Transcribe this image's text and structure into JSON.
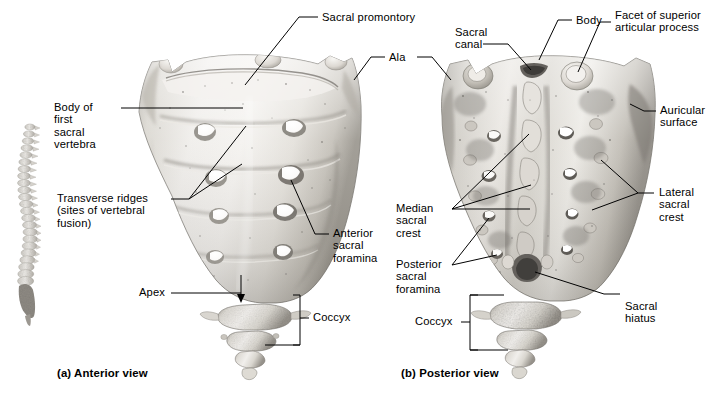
{
  "figure": {
    "background_color": "#ffffff",
    "ink_color": "#000000",
    "bone_tone_light": "#f2f0ec",
    "bone_tone_mid": "#c9c6bf",
    "bone_tone_dark": "#8d8a84"
  },
  "captions": {
    "a": "(a) Anterior view",
    "b": "(b) Posterior view"
  },
  "labels": {
    "sacral_promontory": "Sacral promontory",
    "ala": "Ala",
    "sacral_canal": "Sacral\ncanal",
    "body": "Body",
    "facet_superior_articular": "Facet of superior\narticular process",
    "body_first_sacral_vertebra": "Body of\nfirst\nsacral\nvertebra",
    "transverse_ridges": "Transverse ridges\n(sites of vertebral\nfusion)",
    "anterior_sacral_foramina": "Anterior\nsacral\nforamina",
    "apex": "Apex",
    "coccyx_a": "Coccyx",
    "coccyx_b": "Coccyx",
    "auricular_surface": "Auricular\nsurface",
    "lateral_sacral_crest": "Lateral\nsacral\ncrest",
    "median_sacral_crest": "Median\nsacral\ncrest",
    "posterior_sacral_foramina": "Posterior\nsacral\nforamina",
    "sacral_hiatus": "Sacral\nhiatus"
  },
  "inset": {
    "name": "vertebral-column-lateral-silhouette"
  }
}
